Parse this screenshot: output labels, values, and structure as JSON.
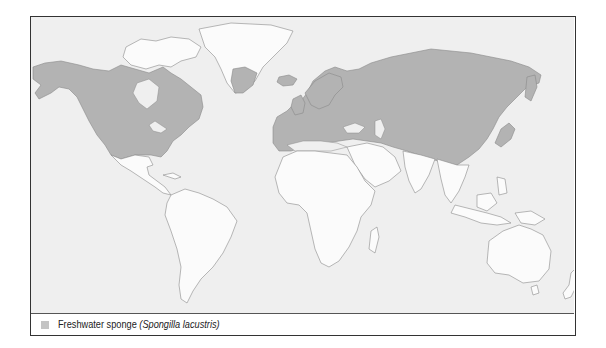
{
  "map": {
    "title": "",
    "regions_highlighted": [
      "North America (Canada, USA)",
      "Greenland (southern)",
      "Iceland",
      "Europe",
      "Russia / Northern Asia",
      "Central Asia",
      "China",
      "Korea",
      "Japan (north)"
    ],
    "colors": {
      "ocean": "#efefef",
      "land": "#fbfbfb",
      "range": "#b3b3b3",
      "outline": "#8a8a8a",
      "frame": "#333333"
    }
  },
  "legend": {
    "swatch_color": "#c4c4c4",
    "label_common": "Freshwater sponge ",
    "label_scientific": "(Spongilla lacustris)"
  }
}
